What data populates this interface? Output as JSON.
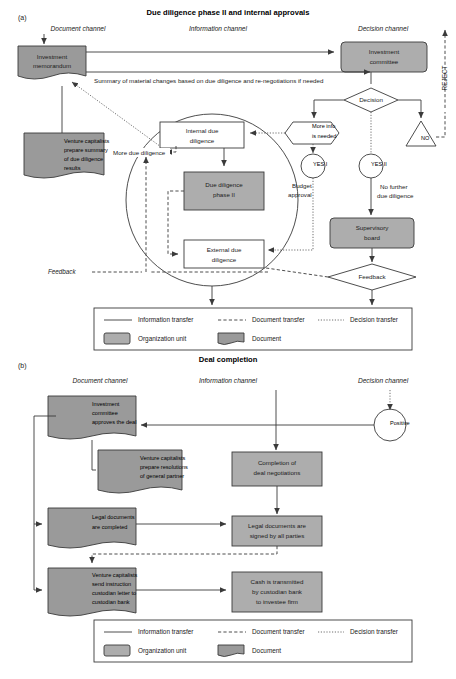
{
  "panel_a": {
    "letter": "(a)",
    "title": "Due diligence phase II and internal approvals",
    "channels": {
      "document": "Document channel",
      "information": "Information channel",
      "decision": "Decision channel"
    },
    "reject_label": "REJECT",
    "nodes": {
      "investment_memorandum": "Investment\nmemorandum",
      "investment_committee": "Investment\ncommittee",
      "vc_prepare_summary": "Venture capitalists\nprepare summary\nof due diligence\nresults",
      "internal_due_diligence": "Internal due\ndiligence",
      "due_diligence_phase_ii": "Due diligence\nphase II",
      "external_due_diligence": "External due\ndiligence",
      "decision": "Decision",
      "more_info_is_needed": "More info\nis needed",
      "no": "NO",
      "yes_i": "YES I",
      "yes_ii": "YES II",
      "supervisory_board": "Supervisory\nboard",
      "feedback_right": "Feedback"
    },
    "edge_labels": {
      "summary_of_changes": "Summary of material changes based on due diligence and re-negotiations if needed",
      "more_due_diligence": "More due diligence",
      "budget_approval": "Budget\napproval",
      "no_further_dd": "No further\ndue diligence",
      "feedback_left": "Feedback"
    }
  },
  "panel_b": {
    "letter": "(b)",
    "title": "Deal completion",
    "channels": {
      "document": "Document channel",
      "information": "Information channel",
      "decision": "Decision channel"
    },
    "nodes": {
      "ic_approves_deal": "Investment\ncommittee\napproves the deal",
      "vc_prepare_resolutions": "Venture capitalists\nprepare resolutions\nof general partner",
      "legal_docs_completed": "Legal documents\nare completed",
      "vc_send_instruction": "Venture capitalists\nsend instruction\ncustodian letter to\ncustodian bank",
      "completion_of_negotiations": "Completion of\ndeal negotiations",
      "legal_docs_signed": "Legal documents are\nsigned by all parties",
      "cash_transmitted": "Cash is transmitted\nby custodian bank\nto investee firm",
      "positive": "Positive"
    }
  },
  "legend": {
    "information_transfer": "Information transfer",
    "document_transfer": "Document transfer",
    "decision_transfer": "Decision transfer",
    "organization_unit": "Organization unit",
    "document": "Document"
  },
  "colors": {
    "org_unit_fill": "#adadad",
    "document_fill": "#9a9a9a",
    "stroke": "#3a3a3a",
    "background": "#ffffff"
  }
}
